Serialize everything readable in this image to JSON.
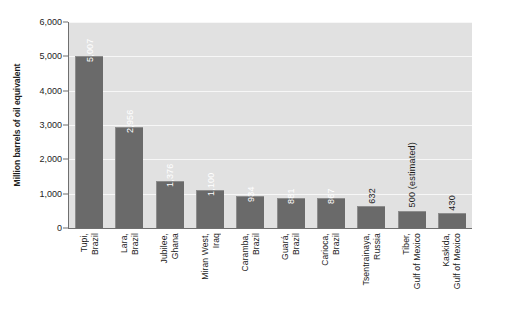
{
  "chart_data": {
    "type": "bar",
    "title": "",
    "subtitle": "",
    "xlabel": "",
    "ylabel": "Million barrels of oil equivalent",
    "ylim": [
      0,
      6000
    ],
    "y_ticks": [
      0,
      1000,
      2000,
      3000,
      4000,
      5000,
      6000
    ],
    "y_tick_labels": [
      "0",
      "1,000",
      "2,000",
      "3,000",
      "4,000",
      "5,000",
      "6,000"
    ],
    "grid": "horizontal",
    "legend": "none",
    "categories": [
      "Tupi, Brazil",
      "Lara, Brazil",
      "Jubilee, Ghana",
      "Miran West, Iraq",
      "Caramba, Brazil",
      "Guará, Brazil",
      "Carioca, Brazil",
      "Tsentrainaya, Russia",
      "Tiber, Gulf of Mexico",
      "Kaskida, Gulf of Mexico"
    ],
    "category_lines": [
      [
        "Tupi,",
        "Brazil"
      ],
      [
        "Lara,",
        "Brazil"
      ],
      [
        "Jubilee,",
        "Ghana"
      ],
      [
        "Miran West,",
        "Iraq"
      ],
      [
        "Caramba,",
        "Brazil"
      ],
      [
        "Guará,",
        "Brazil"
      ],
      [
        "Carioca,",
        "Brazil"
      ],
      [
        "Tsentrainaya,",
        "Russia"
      ],
      [
        "Tiber,",
        "Gulf of Mexico"
      ],
      [
        "Kaskida,",
        "Gulf of Mexico"
      ]
    ],
    "values": [
      5007,
      2956,
      1376,
      1100,
      934,
      881,
      867,
      632,
      500,
      430
    ],
    "value_labels": [
      "5,007",
      "2,956",
      "1,376",
      "1,100",
      "934",
      "881",
      "867",
      "632",
      "500 (estimated)",
      "430"
    ],
    "label_placement": [
      "inside",
      "inside",
      "inside",
      "inside",
      "inside",
      "inside",
      "inside",
      "outside",
      "outside",
      "outside"
    ]
  },
  "style": {
    "bar_color": "#6a6a6a",
    "plot_background": "#e1e1e1",
    "gridline_color": "#f7f7f7",
    "axis_color": "#6f6f6f",
    "text_color": "#1d1d1d",
    "inside_label_color": "#ffffff",
    "page_background": "#ffffff"
  }
}
